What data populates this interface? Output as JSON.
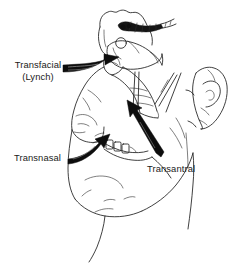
{
  "figure": {
    "type": "anatomical-line-drawing",
    "background_color": "#ffffff",
    "ink_color": "#1a1a1a",
    "arrow_color": "#0d0d0d",
    "labels": [
      {
        "id": "transfacial",
        "line1": "Transfacial",
        "line2": "(Lynch)",
        "x": 12,
        "y": 68,
        "align": "middle",
        "arrow": {
          "name": "transfacial-arrow",
          "direction": "points up and to the right toward the frontal sinus / medial canthus region",
          "start_x": 63,
          "start_y": 72,
          "end_x": 119,
          "end_y": 57
        }
      },
      {
        "id": "transnasal",
        "line1": "Transnasal",
        "line2": "",
        "x": 14,
        "y": 158,
        "align": "start",
        "arrow": {
          "name": "transnasal-arrow",
          "direction": "points up and to the right toward the nasal cavity",
          "start_x": 70,
          "start_y": 160,
          "end_x": 104,
          "end_y": 128
        }
      },
      {
        "id": "transantral",
        "line1": "Transantral",
        "line2": "",
        "x": 147,
        "y": 170,
        "align": "start",
        "arrow": {
          "name": "transantral-arrow",
          "direction": "points up and to the left through the maxillary antrum",
          "start_x": 160,
          "start_y": 157,
          "end_x": 136,
          "end_y": 102
        }
      }
    ],
    "features": [
      {
        "name": "forehead-and-frontal-sinus",
        "description": "scalloped outline of frontal sinus at top of skull"
      },
      {
        "name": "surgical-instrument",
        "description": "dark hatched instrument entering the frontal sinus region"
      },
      {
        "name": "orbit-and-globe",
        "description": "eye socket with circular globe outline"
      },
      {
        "name": "nose",
        "description": "lateral nasal profile"
      },
      {
        "name": "upper-teeth",
        "description": "row of maxillary teeth"
      },
      {
        "name": "maxillary-sinus",
        "description": "antral cavity outline behind the cheek"
      },
      {
        "name": "ear",
        "description": "auricle on right side of drawing"
      },
      {
        "name": "mandible-and-chin",
        "description": "lower jaw and chin outline"
      },
      {
        "name": "neck",
        "description": "neck contour descending from the jaw"
      }
    ]
  }
}
